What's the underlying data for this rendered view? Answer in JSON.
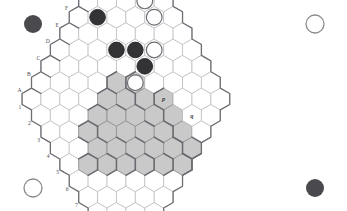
{
  "figure": {
    "name": "hex-board-diagram",
    "board_size": 11,
    "orientation": "pointy-top-rhombus"
  },
  "colors": {
    "background": "#ffffff",
    "cell_fill": "#ffffff",
    "cell_stroke": "#b9b9bd",
    "shaded_fill": "#c9c9c9",
    "shaded_stroke": "#8f8f93",
    "border": "#6e6e74",
    "black_stone": "#333336",
    "white_stone": "#ffffff",
    "label": "#4a4a50"
  },
  "axes": {
    "letters": [
      "A",
      "B",
      "C",
      "D",
      "E",
      "F",
      "G",
      "H",
      "I",
      "J",
      "K"
    ],
    "numbers": [
      "1",
      "2",
      "3",
      "4",
      "5",
      "6",
      "7",
      "8",
      "9",
      "10",
      "11"
    ]
  },
  "cell_labels": [
    {
      "text": "p",
      "col": 7,
      "row": 7
    },
    {
      "text": "q",
      "col": 8,
      "row": 9
    }
  ],
  "shaded_cells": [
    {
      "col": 2,
      "row": 4
    },
    {
      "col": 3,
      "row": 4
    },
    {
      "col": 4,
      "row": 4
    },
    {
      "col": 5,
      "row": 4
    },
    {
      "col": 1,
      "row": 5
    },
    {
      "col": 2,
      "row": 5
    },
    {
      "col": 3,
      "row": 5
    },
    {
      "col": 4,
      "row": 5
    },
    {
      "col": 5,
      "row": 5
    },
    {
      "col": 6,
      "row": 5
    },
    {
      "col": 2,
      "row": 6
    },
    {
      "col": 3,
      "row": 6
    },
    {
      "col": 4,
      "row": 6
    },
    {
      "col": 5,
      "row": 6
    },
    {
      "col": 6,
      "row": 6
    },
    {
      "col": 3,
      "row": 7
    },
    {
      "col": 4,
      "row": 7
    },
    {
      "col": 5,
      "row": 7
    },
    {
      "col": 6,
      "row": 7
    },
    {
      "col": 7,
      "row": 7
    },
    {
      "col": 4,
      "row": 8
    },
    {
      "col": 5,
      "row": 8
    },
    {
      "col": 6,
      "row": 8
    },
    {
      "col": 7,
      "row": 8
    },
    {
      "col": 5,
      "row": 9
    },
    {
      "col": 6,
      "row": 9
    },
    {
      "col": 7,
      "row": 9
    },
    {
      "col": 6,
      "row": 10
    },
    {
      "col": 7,
      "row": 10
    }
  ],
  "stones": [
    {
      "color": "black",
      "col": 6,
      "row": 1
    },
    {
      "color": "black",
      "col": 6,
      "row": 3
    },
    {
      "color": "white",
      "col": 9,
      "row": 3
    },
    {
      "color": "black",
      "col": 7,
      "row": 4
    },
    {
      "color": "white",
      "col": 9,
      "row": 4
    },
    {
      "color": "white",
      "col": 6,
      "row": 5
    },
    {
      "color": "black",
      "col": 7,
      "row": 5
    },
    {
      "color": "white",
      "col": 8,
      "row": 5
    }
  ],
  "corner_markers": [
    {
      "name": "corner-marker-top-left",
      "color": "black",
      "x": 33,
      "y": 24,
      "r": 9
    },
    {
      "name": "corner-marker-top-right",
      "color": "white",
      "x": 315,
      "y": 24,
      "r": 9
    },
    {
      "name": "corner-marker-bottom-left",
      "color": "white",
      "x": 33,
      "y": 188,
      "r": 9
    },
    {
      "name": "corner-marker-bottom-right",
      "color": "black",
      "x": 315,
      "y": 188,
      "r": 9
    }
  ]
}
